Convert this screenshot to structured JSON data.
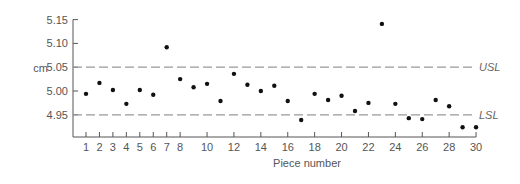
{
  "chart_data": {
    "type": "scatter",
    "title": "",
    "xlabel": "Piece number",
    "ylabel": "cm",
    "ylim": [
      4.92,
      5.15
    ],
    "xlim": [
      1,
      30
    ],
    "grid": false,
    "y_ticks": [
      "5.15",
      "5.10",
      "5.05",
      "5.00",
      "4.95"
    ],
    "y_tick_values": [
      5.15,
      5.1,
      5.05,
      5.0,
      4.95
    ],
    "x_ticks": [
      1,
      2,
      3,
      4,
      5,
      6,
      7,
      8,
      10,
      12,
      14,
      16,
      18,
      20,
      22,
      24,
      26,
      28,
      30
    ],
    "limits": [
      {
        "name": "USL",
        "value": 5.05,
        "style": "dashed"
      },
      {
        "name": "LSL",
        "value": 4.95,
        "style": "dashed"
      }
    ],
    "series": [
      {
        "name": "Piece measurements",
        "x": [
          1,
          2,
          3,
          4,
          5,
          6,
          7,
          8,
          9,
          10,
          11,
          12,
          13,
          14,
          15,
          16,
          17,
          18,
          19,
          20,
          21,
          22,
          23,
          24,
          25,
          26,
          27,
          28,
          29,
          30
        ],
        "values": [
          4.994,
          5.017,
          5.002,
          4.973,
          5.002,
          4.992,
          5.092,
          5.025,
          5.008,
          5.015,
          4.979,
          5.036,
          5.013,
          5.0,
          5.011,
          4.979,
          4.939,
          4.994,
          4.981,
          4.99,
          4.958,
          4.975,
          5.141,
          4.973,
          4.943,
          4.941,
          4.981,
          4.968,
          4.924,
          4.924
        ]
      }
    ]
  },
  "colors": {
    "axis": "#555555",
    "points": "#111111",
    "limit_lines": "#999999",
    "text": "#555555"
  }
}
